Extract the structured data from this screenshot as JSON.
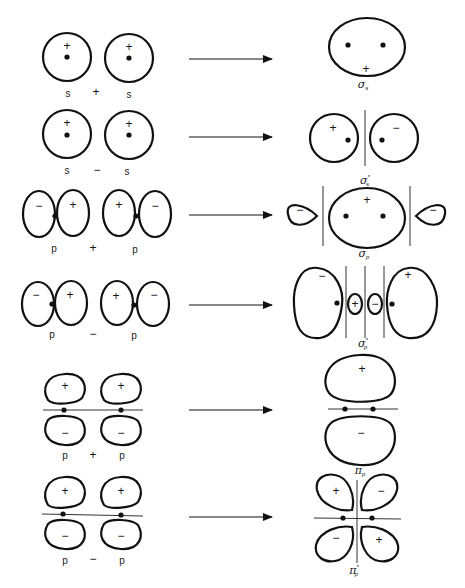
{
  "signs": {
    "plus": "+",
    "minus": "−"
  },
  "rows": [
    {
      "left": "s",
      "op": "+",
      "right": "s",
      "result": "σ",
      "result_sub": "s",
      "result_star": ""
    },
    {
      "left": "s",
      "op": "−",
      "right": "s",
      "result": "σ",
      "result_sub": "s",
      "result_star": "*"
    },
    {
      "left": "p",
      "op": "+",
      "right": "p",
      "result": "σ",
      "result_sub": "p",
      "result_star": ""
    },
    {
      "left": "p",
      "op": "−",
      "right": "p",
      "result": "σ",
      "result_sub": "p",
      "result_star": "*"
    },
    {
      "left": "p",
      "op": "+",
      "right": "p",
      "result": "π",
      "result_sub": "p",
      "result_star": ""
    },
    {
      "left": "p",
      "op": "−",
      "right": "p",
      "result": "π",
      "result_sub": "p",
      "result_star": "*"
    }
  ],
  "colors": {
    "ink": "#111111",
    "background": "#ffffff"
  }
}
